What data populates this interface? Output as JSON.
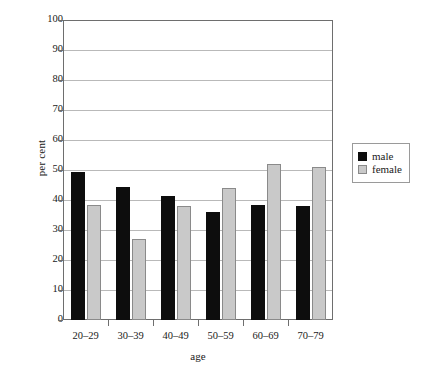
{
  "chart_data": {
    "type": "bar",
    "title": "",
    "subtitle": "",
    "xlabel": "age",
    "ylabel": "per cent",
    "categories": [
      "20–29",
      "30–39",
      "40–49",
      "50–59",
      "60–69",
      "70–79"
    ],
    "series": [
      {
        "name": "male",
        "color": "#0d0d0d",
        "values": [
          49.5,
          44.5,
          41.5,
          36.0,
          38.5,
          38.0
        ]
      },
      {
        "name": "female",
        "color": "#c9c9c9",
        "values": [
          38.5,
          27.0,
          38.0,
          44.0,
          52.0,
          51.0
        ]
      }
    ],
    "ylim": [
      0,
      100
    ],
    "ytick_step": 10,
    "yticks": [
      0,
      10,
      20,
      30,
      40,
      50,
      60,
      70,
      80,
      90,
      100
    ],
    "ytick_labels": [
      "0",
      "10",
      "20",
      "30",
      "40",
      "50",
      "60",
      "70",
      "80",
      "90",
      "100"
    ],
    "grid": true,
    "grid_axis": "y",
    "legend_position": "right",
    "legend_entries": [
      "male",
      "female"
    ],
    "frame": true,
    "bar_group_gap": true
  },
  "axes": {
    "y_axis_label": "per cent",
    "x_axis_label": "age"
  },
  "legend": {
    "items": [
      {
        "label": "male",
        "swatch": "black-square-icon"
      },
      {
        "label": "female",
        "swatch": "gray-square-icon"
      }
    ]
  }
}
